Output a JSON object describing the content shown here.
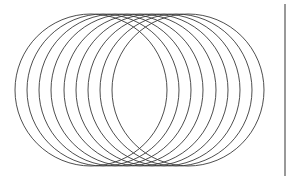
{
  "diagram": {
    "type": "overlapping-circles",
    "stroke_color": "#3a3a3a",
    "background": "#ffffff",
    "circle_count": 9,
    "radius": 76,
    "center_y": 90,
    "centers_x": [
      91,
      103,
      115,
      127,
      140,
      152,
      164,
      176,
      188
    ],
    "right_border": {
      "x": 285,
      "y1": 4,
      "y2": 176,
      "color": "#555555"
    }
  }
}
